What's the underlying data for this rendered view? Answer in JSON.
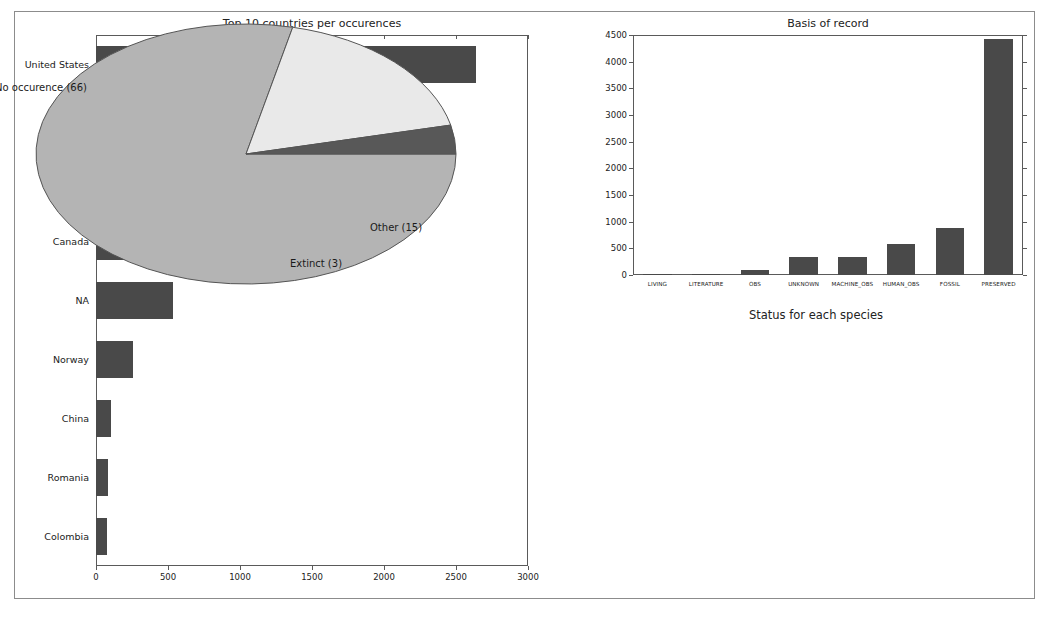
{
  "figure": {
    "background": "#ffffff",
    "frame_color": "#8c8c8c",
    "bar_color": "#494949",
    "axis_color": "#5a5a5a"
  },
  "chart_data": [
    {
      "type": "bar",
      "orientation": "horizontal",
      "title": "Top 10 countries per occurences",
      "xlabel": "",
      "ylabel": "",
      "xlim": [
        0,
        3000
      ],
      "xticks": [
        "0",
        "500",
        "1000",
        "1500",
        "2000",
        "2500",
        "3000"
      ],
      "grid": false,
      "categories": [
        "United States",
        "Poland",
        "Germany",
        "Canada",
        "NA",
        "Norway",
        "China",
        "Romania",
        "Colombia"
      ],
      "values": [
        2640,
        970,
        735,
        725,
        535,
        260,
        105,
        80,
        75
      ],
      "bar_color": "#494949"
    },
    {
      "type": "bar",
      "orientation": "vertical",
      "title": "Basis of record",
      "xlabel": "",
      "ylabel": "",
      "ylim": [
        0,
        4500
      ],
      "yticks": [
        "0",
        "500",
        "1000",
        "1500",
        "2000",
        "2500",
        "3000",
        "3500",
        "4000",
        "4500"
      ],
      "grid": false,
      "categories": [
        "LIVING",
        "LITERATURE",
        "OBS",
        "UNKNOWN",
        "MACHINE_OBS",
        "HUMAN_OBS",
        "FOSSIL",
        "PRESERVED"
      ],
      "values": [
        3,
        18,
        95,
        340,
        340,
        580,
        890,
        4420
      ],
      "bar_color": "#494949"
    },
    {
      "type": "pie",
      "title": "Status for each species",
      "legend_position": "outside-labels",
      "slices": [
        {
          "label": "No occurence (66)",
          "value": 66,
          "color": "#b4b4b4"
        },
        {
          "label": "Other (15)",
          "value": 15,
          "color": "#e9e9e9"
        },
        {
          "label": "Extinct (3)",
          "value": 3,
          "color": "#585858"
        }
      ]
    }
  ]
}
